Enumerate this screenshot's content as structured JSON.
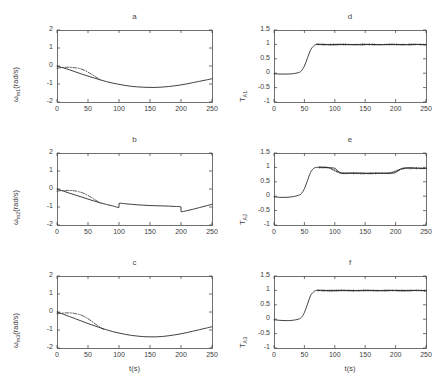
{
  "figure": {
    "width": 436,
    "height": 378,
    "background": "#ffffff",
    "line_color": "#2b2b2b",
    "axis_color": "#4d4d4d",
    "layout": "2 columns x 3 rows of subplots"
  },
  "chart_data": [
    {
      "id": "a",
      "type": "line",
      "title": "a",
      "xlabel": "",
      "ylabel": "ωm1(rad/s)",
      "ylabel_base": "ω",
      "ylabel_sub": "m1",
      "ylabel_unit": "(rad/s)",
      "xlim": [
        0,
        250
      ],
      "ylim": [
        -2,
        2
      ],
      "xticks": [
        0,
        50,
        100,
        150,
        200,
        250
      ],
      "yticks": [
        -2,
        -1,
        0,
        1,
        2
      ],
      "grid": false,
      "legend": "none",
      "series": [
        {
          "name": "actual",
          "style": "solid",
          "x": [
            0,
            10,
            20,
            30,
            40,
            50,
            60,
            70,
            80,
            90,
            100,
            110,
            120,
            130,
            140,
            150,
            160,
            170,
            180,
            190,
            200,
            210,
            220,
            230,
            240,
            250
          ],
          "values": [
            0.0,
            -0.1,
            -0.21,
            -0.33,
            -0.45,
            -0.56,
            -0.67,
            -0.77,
            -0.87,
            -0.95,
            -1.02,
            -1.08,
            -1.13,
            -1.16,
            -1.18,
            -1.19,
            -1.19,
            -1.17,
            -1.14,
            -1.1,
            -1.05,
            -0.99,
            -0.92,
            -0.85,
            -0.78,
            -0.71
          ]
        },
        {
          "name": "estimated",
          "style": "dash-dot",
          "x": [
            0,
            5,
            10,
            15,
            20,
            25,
            30,
            35,
            40,
            45,
            50,
            55,
            60,
            65,
            70
          ],
          "values": [
            -0.12,
            -0.1,
            -0.08,
            -0.07,
            -0.07,
            -0.08,
            -0.1,
            -0.13,
            -0.18,
            -0.25,
            -0.34,
            -0.45,
            -0.55,
            -0.66,
            -0.77
          ]
        }
      ]
    },
    {
      "id": "b",
      "type": "line",
      "title": "b",
      "xlabel": "",
      "ylabel": "ωm2(rad/s)",
      "ylabel_base": "ω",
      "ylabel_sub": "m2",
      "ylabel_unit": "(rad/s)",
      "xlim": [
        0,
        250
      ],
      "ylim": [
        -2,
        2
      ],
      "xticks": [
        0,
        50,
        100,
        150,
        200,
        250
      ],
      "yticks": [
        -2,
        -1,
        0,
        1,
        2
      ],
      "grid": false,
      "legend": "none",
      "step_events": [
        {
          "t": 100,
          "direction": "up",
          "magnitude": 0.22
        },
        {
          "t": 200,
          "direction": "down",
          "magnitude": 0.25
        }
      ],
      "series": [
        {
          "name": "actual",
          "style": "solid",
          "x": [
            0,
            10,
            20,
            30,
            40,
            50,
            60,
            70,
            80,
            90,
            100,
            100,
            110,
            120,
            130,
            140,
            150,
            160,
            170,
            180,
            190,
            200,
            200,
            210,
            220,
            230,
            240,
            250
          ],
          "values": [
            0.0,
            -0.11,
            -0.23,
            -0.34,
            -0.45,
            -0.56,
            -0.67,
            -0.77,
            -0.86,
            -0.94,
            -1.02,
            -0.8,
            -0.82,
            -0.85,
            -0.88,
            -0.9,
            -0.92,
            -0.93,
            -0.94,
            -0.95,
            -0.97,
            -1.0,
            -1.25,
            -1.2,
            -1.12,
            -1.03,
            -0.94,
            -0.85
          ]
        },
        {
          "name": "estimated",
          "style": "dash-dot",
          "x": [
            0,
            5,
            10,
            15,
            20,
            25,
            30,
            35,
            40,
            45,
            50,
            55,
            60,
            65,
            70
          ],
          "values": [
            -0.12,
            -0.1,
            -0.09,
            -0.08,
            -0.08,
            -0.09,
            -0.11,
            -0.15,
            -0.2,
            -0.27,
            -0.36,
            -0.46,
            -0.57,
            -0.68,
            -0.78
          ]
        }
      ]
    },
    {
      "id": "c",
      "type": "line",
      "title": "c",
      "xlabel": "t(s)",
      "ylabel": "ωm3(rad/s)",
      "ylabel_base": "ω",
      "ylabel_sub": "m3",
      "ylabel_unit": "(rad/s)",
      "xlim": [
        0,
        250
      ],
      "ylim": [
        -2,
        2
      ],
      "xticks": [
        0,
        50,
        100,
        150,
        200,
        250
      ],
      "yticks": [
        -2,
        -1,
        0,
        1,
        2
      ],
      "grid": false,
      "legend": "none",
      "series": [
        {
          "name": "actual",
          "style": "solid",
          "x": [
            0,
            10,
            20,
            30,
            40,
            50,
            60,
            70,
            80,
            90,
            100,
            110,
            120,
            130,
            140,
            150,
            160,
            170,
            180,
            190,
            200,
            210,
            220,
            230,
            240,
            250
          ],
          "values": [
            0.0,
            -0.12,
            -0.25,
            -0.38,
            -0.51,
            -0.64,
            -0.76,
            -0.88,
            -0.99,
            -1.09,
            -1.17,
            -1.24,
            -1.3,
            -1.34,
            -1.37,
            -1.38,
            -1.38,
            -1.36,
            -1.32,
            -1.27,
            -1.21,
            -1.14,
            -1.06,
            -0.98,
            -0.9,
            -0.82
          ]
        },
        {
          "name": "estimated",
          "style": "dash-dot",
          "x": [
            0,
            5,
            10,
            15,
            20,
            25,
            30,
            35,
            40,
            45,
            50,
            55,
            60,
            65,
            70,
            75
          ],
          "values": [
            -0.1,
            -0.08,
            -0.06,
            -0.05,
            -0.05,
            -0.06,
            -0.09,
            -0.13,
            -0.19,
            -0.27,
            -0.37,
            -0.49,
            -0.62,
            -0.74,
            -0.86,
            -0.96
          ]
        }
      ]
    },
    {
      "id": "d",
      "type": "line",
      "title": "d",
      "xlabel": "",
      "ylabel": "TA1",
      "ylabel_base": "T",
      "ylabel_sub": "A1",
      "ylabel_unit": "",
      "xlim": [
        0,
        250
      ],
      "ylim": [
        -1,
        1.5
      ],
      "xticks": [
        0,
        50,
        100,
        150,
        200,
        250
      ],
      "yticks": [
        -1,
        -0.5,
        0,
        0.5,
        1,
        1.5
      ],
      "grid": false,
      "legend": "none",
      "series": [
        {
          "name": "actual",
          "style": "solid",
          "x": [
            0,
            10,
            20,
            30,
            40,
            45,
            50,
            55,
            60,
            65,
            70,
            80,
            100,
            120,
            140,
            160,
            180,
            200,
            220,
            240,
            250
          ],
          "values": [
            -0.02,
            -0.03,
            -0.03,
            -0.02,
            0.02,
            0.08,
            0.25,
            0.52,
            0.8,
            0.94,
            1.0,
            1.0,
            0.99,
            1.0,
            0.99,
            1.0,
            0.99,
            1.0,
            0.99,
            1.0,
            0.98
          ]
        },
        {
          "name": "estimated",
          "style": "dash-dot-noisy",
          "x": [
            70,
            90,
            110,
            130,
            150,
            170,
            190,
            210,
            230,
            250
          ],
          "values": [
            1.0,
            0.99,
            1.0,
            0.99,
            1.0,
            0.99,
            1.0,
            0.99,
            1.0,
            0.99
          ]
        }
      ]
    },
    {
      "id": "e",
      "type": "line",
      "title": "e",
      "xlabel": "",
      "ylabel": "TA2",
      "ylabel_base": "T",
      "ylabel_sub": "A2",
      "ylabel_unit": "",
      "xlim": [
        0,
        250
      ],
      "ylim": [
        -1,
        1.5
      ],
      "xticks": [
        0,
        50,
        100,
        150,
        200,
        250
      ],
      "yticks": [
        -1,
        -0.5,
        0,
        0.5,
        1,
        1.5
      ],
      "grid": false,
      "legend": "none",
      "step_events": [
        {
          "t": 100,
          "direction": "down",
          "to": 0.8
        },
        {
          "t": 205,
          "direction": "up",
          "to": 0.97
        }
      ],
      "series": [
        {
          "name": "actual",
          "style": "solid",
          "x": [
            0,
            10,
            20,
            30,
            40,
            45,
            50,
            55,
            60,
            65,
            70,
            80,
            90,
            100,
            105,
            110,
            120,
            140,
            160,
            180,
            195,
            200,
            205,
            210,
            220,
            240,
            250
          ],
          "values": [
            -0.02,
            -0.04,
            -0.04,
            -0.02,
            0.03,
            0.09,
            0.26,
            0.54,
            0.82,
            0.96,
            1.0,
            1.0,
            0.99,
            0.97,
            0.88,
            0.81,
            0.8,
            0.8,
            0.79,
            0.8,
            0.8,
            0.82,
            0.9,
            0.96,
            0.98,
            0.97,
            0.96
          ]
        },
        {
          "name": "estimated",
          "style": "dash-dot-noisy",
          "x": [
            75,
            90,
            110,
            130,
            150,
            170,
            190,
            215,
            235,
            250
          ],
          "values": [
            1.0,
            0.99,
            0.8,
            0.8,
            0.79,
            0.8,
            0.8,
            0.97,
            0.97,
            0.96
          ]
        }
      ]
    },
    {
      "id": "f",
      "type": "line",
      "title": "f",
      "xlabel": "t(s)",
      "ylabel": "TA3",
      "ylabel_base": "T",
      "ylabel_sub": "A3",
      "ylabel_unit": "",
      "xlim": [
        0,
        250
      ],
      "ylim": [
        -1,
        1.5
      ],
      "xticks": [
        0,
        50,
        100,
        150,
        200,
        250
      ],
      "yticks": [
        -1,
        -0.5,
        0,
        0.5,
        1,
        1.5
      ],
      "grid": false,
      "legend": "none",
      "series": [
        {
          "name": "actual",
          "style": "solid",
          "x": [
            0,
            10,
            20,
            30,
            40,
            45,
            50,
            55,
            60,
            65,
            70,
            80,
            100,
            120,
            140,
            160,
            180,
            200,
            220,
            240,
            250
          ],
          "values": [
            -0.02,
            -0.04,
            -0.05,
            -0.04,
            0.0,
            0.06,
            0.23,
            0.52,
            0.81,
            0.95,
            1.0,
            1.0,
            0.99,
            1.0,
            0.99,
            1.0,
            0.99,
            1.0,
            0.99,
            1.0,
            0.98
          ]
        },
        {
          "name": "estimated",
          "style": "dash-dot-noisy",
          "x": [
            72,
            90,
            110,
            130,
            150,
            170,
            190,
            210,
            230,
            250
          ],
          "values": [
            1.0,
            0.99,
            1.0,
            0.99,
            1.0,
            0.99,
            1.0,
            0.99,
            1.0,
            0.99
          ]
        }
      ]
    }
  ]
}
